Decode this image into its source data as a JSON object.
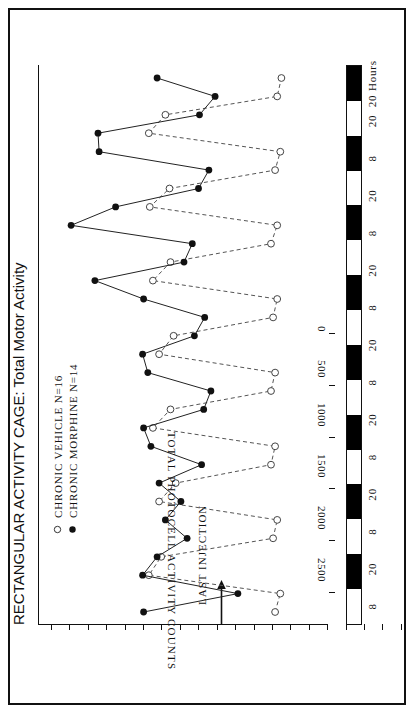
{
  "figure": {
    "title": "RECTANGULAR ACTIVITY CAGE: Total Motor Activity",
    "value_axis_title": "TOTAL PHOTOCELL ACTIVITY COUNTS",
    "hours_unit_label": "Hours",
    "annotation_label": "LAST INJECTION"
  },
  "legend": [
    {
      "label": "CHRONIC  VEHICLE  N=16",
      "marker": "open-circle",
      "name": "legend-item-vehicle"
    },
    {
      "label": "CHRONIC  MORPHINE  N=14",
      "marker": "filled-circle",
      "name": "legend-item-morphine"
    }
  ],
  "value_ticks": [
    "0",
    "500",
    "1000",
    "1500",
    "2000",
    "2500"
  ],
  "hour_labels": [
    "8",
    "20",
    "8",
    "20",
    "8",
    "20",
    "8",
    "20",
    "8",
    "20",
    "8",
    "20",
    "8",
    "20",
    "20 Hours"
  ],
  "light_dark_bands": [
    "light",
    "dark",
    "light",
    "dark",
    "light",
    "dark",
    "light",
    "dark",
    "light",
    "dark",
    "light",
    "dark",
    "light",
    "dark",
    "light",
    "dark"
  ],
  "colors": {
    "foreground": "#111111",
    "dark_band": "#000000",
    "light_band": "#ffffff",
    "vehicle_line": "#555555",
    "morphine_line": "#222222"
  },
  "chart_data": {
    "type": "line",
    "title": "RECTANGULAR ACTIVITY CAGE: Total Motor Activity",
    "xlabel": "Hours",
    "ylabel": "TOTAL PHOTOCELL ACTIVITY COUNTS",
    "ylim": [
      0,
      2800
    ],
    "xlim": [
      0,
      30
    ],
    "grid": false,
    "legend_position": "top-left",
    "orientation": "rotated-90ccw",
    "xtick_labels": [
      "8",
      "20",
      "8",
      "20",
      "8",
      "20",
      "8",
      "20",
      "8",
      "20",
      "8",
      "20",
      "8",
      "20",
      "20"
    ],
    "ytick_values": [
      0,
      500,
      1000,
      1500,
      2000,
      2500
    ],
    "annotations": [
      {
        "text": "LAST INJECTION",
        "x": 0.5,
        "note": "arrow marks last injection time at start of record"
      }
    ],
    "x": [
      0,
      1,
      2,
      3,
      4,
      5,
      6,
      7,
      8,
      9,
      10,
      11,
      12,
      13,
      14,
      15,
      16,
      17,
      18,
      19,
      20,
      21,
      22,
      23,
      24,
      25,
      26,
      27,
      28,
      29
    ],
    "series": [
      {
        "name": "CHRONIC  MORPHINE  N=14",
        "marker": "filled-circle",
        "linestyle": "solid",
        "values": [
          1790,
          880,
          1800,
          1660,
          1370,
          1580,
          1430,
          1640,
          1230,
          1720,
          1790,
          1210,
          1140,
          1750,
          1800,
          1300,
          1200,
          1790,
          2260,
          1400,
          1320,
          2490,
          2060,
          1260,
          1160,
          2220,
          2230,
          1250,
          1100,
          1660
        ]
      },
      {
        "name": "CHRONIC  VEHICLE  N=16",
        "marker": "open-circle",
        "linestyle": "dashed",
        "values": [
          520,
          470,
          1740,
          1620,
          540,
          500,
          1640,
          1480,
          560,
          520,
          1700,
          1530,
          560,
          520,
          1640,
          1500,
          540,
          500,
          1700,
          1530,
          560,
          500,
          1730,
          1540,
          520,
          470,
          1740,
          1580,
          500,
          460
        ]
      }
    ]
  }
}
